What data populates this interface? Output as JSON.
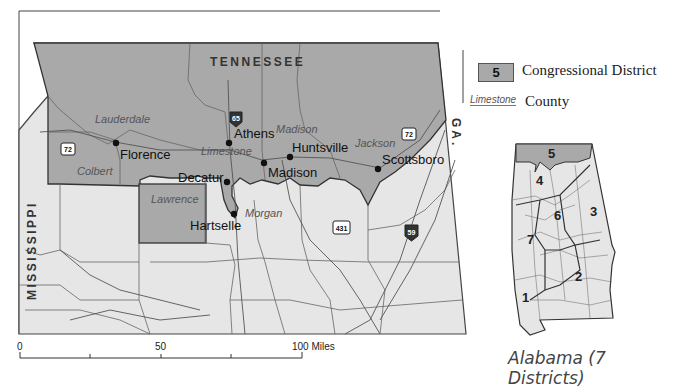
{
  "map": {
    "state_labels": {
      "north": "TENNESSEE",
      "west": "MISSISSIPPI",
      "east": "GA."
    },
    "cities": [
      {
        "name": "Florence"
      },
      {
        "name": "Athens"
      },
      {
        "name": "Huntsville"
      },
      {
        "name": "Madison"
      },
      {
        "name": "Scottsboro"
      },
      {
        "name": "Decatur"
      },
      {
        "name": "Hartselle"
      }
    ],
    "counties": [
      {
        "name": "Lauderdale"
      },
      {
        "name": "Colbert"
      },
      {
        "name": "Limestone"
      },
      {
        "name": "Madison"
      },
      {
        "name": "Jackson"
      },
      {
        "name": "Lawrence"
      },
      {
        "name": "Morgan"
      }
    ],
    "highways": [
      {
        "type": "us",
        "number": "72"
      },
      {
        "type": "us",
        "number": "72"
      },
      {
        "type": "interstate",
        "number": "65"
      },
      {
        "type": "us",
        "number": "431"
      },
      {
        "type": "interstate",
        "number": "59"
      }
    ],
    "district_fill_color": "#a9a9a9",
    "land_fill_color": "#e6e6e6"
  },
  "scale_bar": {
    "labels": [
      "0",
      "50",
      "100 Miles"
    ]
  },
  "legend": {
    "district_swatch_number": "5",
    "district_label": "Congressional District",
    "county_sample": "Limestone",
    "county_label": "County"
  },
  "inset": {
    "title": "Alabama (7 Districts)",
    "district_numbers": [
      "5",
      "4",
      "6",
      "3",
      "7",
      "2",
      "1"
    ],
    "highlighted_district": "5"
  }
}
